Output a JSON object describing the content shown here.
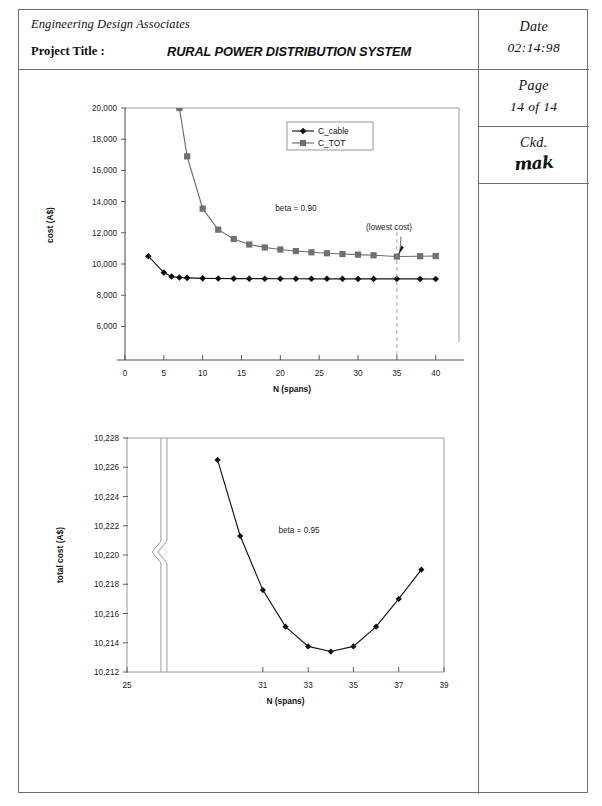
{
  "titleblock": {
    "company": "Engineering Design Associates",
    "project_title_label": "Project Title :",
    "project_title": "RURAL POWER DISTRIBUTION SYSTEM",
    "date_label": "Date",
    "date_value": "02:14:98",
    "page_label": "Page",
    "page_value": "14 of 14",
    "checked_label": "Ckd.",
    "checked_by": "mak"
  },
  "chart_data": [
    {
      "id": "cost-vs-spans",
      "type": "line",
      "title": "",
      "xlabel": "N (spans)",
      "ylabel": "cost (A$)",
      "xlim": [
        0,
        43
      ],
      "ylim": [
        5000,
        20000
      ],
      "xticks": [
        0,
        5,
        10,
        15,
        20,
        25,
        30,
        35,
        40
      ],
      "xticklabels": [
        "0",
        "5",
        "10",
        "15",
        "20",
        "25",
        "30",
        "35",
        "40"
      ],
      "yticks": [
        6000,
        8000,
        10000,
        12000,
        14000,
        16000,
        18000,
        20000
      ],
      "yticklabels": [
        "6,000",
        "8,000",
        "10,000",
        "12,000",
        "14,000",
        "16,000",
        "18,000",
        "20,000"
      ],
      "grid": false,
      "legend_position": "upper-center",
      "annotations": [
        {
          "text": "beta = 0.90",
          "x": 22,
          "y": 13400
        },
        {
          "text": "(lowest cost)",
          "x": 34,
          "y": 12150
        }
      ],
      "series": [
        {
          "name": "C_cable",
          "marker": "diamond",
          "color": "#111111",
          "x": [
            3,
            5,
            6,
            7,
            8,
            10,
            12,
            14,
            16,
            18,
            20,
            22,
            24,
            26,
            28,
            30,
            32,
            35,
            38,
            40
          ],
          "values": [
            10500,
            9450,
            9200,
            9130,
            9110,
            9080,
            9070,
            9065,
            9060,
            9058,
            9055,
            9052,
            9050,
            9050,
            9048,
            9046,
            9045,
            9044,
            9042,
            9040
          ]
        },
        {
          "name": "C_TOT",
          "marker": "square",
          "color": "#6f6f6f",
          "x": [
            6,
            7,
            8,
            10,
            12,
            14,
            16,
            18,
            20,
            22,
            24,
            26,
            28,
            30,
            32,
            35,
            38,
            40
          ],
          "values": [
            27000,
            20000,
            16900,
            13550,
            12200,
            11600,
            11250,
            11060,
            10930,
            10830,
            10750,
            10690,
            10640,
            10600,
            10560,
            10480,
            10500,
            10510
          ]
        }
      ]
    },
    {
      "id": "total-cost-detail",
      "type": "line",
      "title": "",
      "xlabel": "N (spans)",
      "ylabel": "total cost (A$)",
      "xlim": [
        25,
        39
      ],
      "ylim": [
        10212,
        10228
      ],
      "xticks": [
        25,
        31,
        33,
        35,
        37,
        39
      ],
      "xticklabels": [
        "25",
        "31",
        "33",
        "35",
        "37",
        "39"
      ],
      "yticks": [
        10212,
        10214,
        10216,
        10218,
        10220,
        10222,
        10224,
        10226,
        10228
      ],
      "yticklabels": [
        "10,212",
        "10,214",
        "10,216",
        "10,218",
        "10,220",
        "10,222",
        "10,224",
        "10,226",
        "10,228"
      ],
      "grid": false,
      "axis_break": {
        "axis": "x",
        "at": 26.5,
        "style": "double-zigzag"
      },
      "annotations": [
        {
          "text": "beta = 0.95",
          "x": 32.6,
          "y": 10221.5
        }
      ],
      "series": [
        {
          "name": "total cost",
          "marker": "diamond",
          "color": "#111111",
          "x": [
            29,
            30,
            31,
            32,
            33,
            34,
            35,
            36,
            37,
            38
          ],
          "values": [
            10226.5,
            10221.3,
            10217.6,
            10215.1,
            10213.75,
            10213.4,
            10213.75,
            10215.1,
            10217.0,
            10219.0
          ]
        }
      ]
    }
  ]
}
